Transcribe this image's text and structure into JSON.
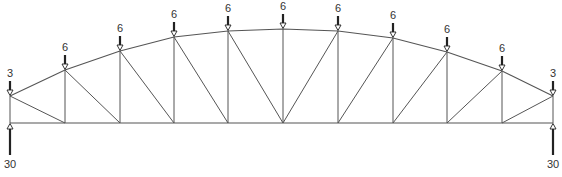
{
  "diagram": {
    "type": "bowstring-truss",
    "colors": {
      "member": "#555555",
      "arrow": "#222222",
      "label": "#333333",
      "background": "#ffffff"
    },
    "bottom_chord_y": 123,
    "top_nodes": [
      {
        "x": 10,
        "y": 96
      },
      {
        "x": 65,
        "y": 70
      },
      {
        "x": 120,
        "y": 51
      },
      {
        "x": 174,
        "y": 37
      },
      {
        "x": 228,
        "y": 31
      },
      {
        "x": 283,
        "y": 29
      },
      {
        "x": 338,
        "y": 31
      },
      {
        "x": 393,
        "y": 38
      },
      {
        "x": 447,
        "y": 52
      },
      {
        "x": 502,
        "y": 71
      },
      {
        "x": 553,
        "y": 96
      }
    ],
    "bottom_nodes_x": [
      10,
      65,
      120,
      174,
      228,
      283,
      338,
      393,
      447,
      502,
      553
    ],
    "diagonals": [
      {
        "from_top": 0,
        "to_bottom": 1
      },
      {
        "from_top": 1,
        "to_bottom": 2
      },
      {
        "from_top": 2,
        "to_bottom": 3
      },
      {
        "from_top": 3,
        "to_bottom": 4
      },
      {
        "from_top": 4,
        "to_bottom": 5
      },
      {
        "from_top": 6,
        "to_bottom": 5
      },
      {
        "from_top": 7,
        "to_bottom": 6
      },
      {
        "from_top": 8,
        "to_bottom": 7
      },
      {
        "from_top": 9,
        "to_bottom": 8
      },
      {
        "from_top": 10,
        "to_bottom": 9
      }
    ],
    "loads": [
      {
        "node": 0,
        "value": "3"
      },
      {
        "node": 1,
        "value": "6"
      },
      {
        "node": 2,
        "value": "6"
      },
      {
        "node": 3,
        "value": "6"
      },
      {
        "node": 4,
        "value": "6"
      },
      {
        "node": 5,
        "value": "6"
      },
      {
        "node": 6,
        "value": "6"
      },
      {
        "node": 7,
        "value": "6"
      },
      {
        "node": 8,
        "value": "6"
      },
      {
        "node": 9,
        "value": "6"
      },
      {
        "node": 10,
        "value": "3"
      }
    ],
    "reactions": [
      {
        "node": 0,
        "value": "30"
      },
      {
        "node": 10,
        "value": "30"
      }
    ]
  }
}
